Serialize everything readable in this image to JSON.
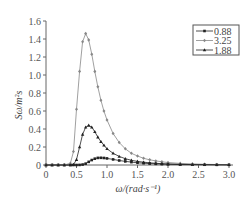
{
  "chart_data": {
    "type": "line",
    "title": "",
    "xlabel": "ω/(rad·s⁻¹)",
    "ylabel": "Sω/m²s",
    "xlim": [
      0,
      3.0
    ],
    "ylim": [
      0,
      1.6
    ],
    "xticks": [
      "0",
      "0.5",
      "1.0",
      "1.5",
      "2.0",
      "2.5",
      "3.0"
    ],
    "yticks": [
      "0",
      "0.2",
      "0.4",
      "0.6",
      "0.8",
      "1.0",
      "1.2",
      "1.4",
      "1.6"
    ],
    "grid": false,
    "legend_position": "upper right",
    "x": [
      0.0,
      0.1,
      0.2,
      0.3,
      0.4,
      0.45,
      0.5,
      0.55,
      0.6,
      0.65,
      0.7,
      0.75,
      0.8,
      0.85,
      0.9,
      0.95,
      1.0,
      1.1,
      1.2,
      1.3,
      1.4,
      1.5,
      1.6,
      1.7,
      1.8,
      1.9,
      2.0,
      2.2,
      2.4,
      2.6,
      2.8,
      3.0
    ],
    "series": [
      {
        "name": "0.88",
        "color": "#222222",
        "marker": "square",
        "values": [
          0,
          0,
          0,
          0,
          0,
          0,
          0,
          0.001,
          0.005,
          0.015,
          0.035,
          0.055,
          0.07,
          0.079,
          0.08,
          0.078,
          0.073,
          0.062,
          0.05,
          0.04,
          0.032,
          0.025,
          0.02,
          0.016,
          0.013,
          0.01,
          0.008,
          0.005,
          0.004,
          0.003,
          0.002,
          0.002
        ]
      },
      {
        "name": "3.25",
        "color": "#888888",
        "marker": "diamond",
        "values": [
          0,
          0,
          0,
          0,
          0.02,
          0.15,
          0.62,
          1.04,
          1.37,
          1.46,
          1.39,
          1.23,
          1.04,
          0.87,
          0.72,
          0.6,
          0.5,
          0.35,
          0.25,
          0.18,
          0.13,
          0.1,
          0.075,
          0.058,
          0.045,
          0.035,
          0.028,
          0.018,
          0.012,
          0.008,
          0.006,
          0.004
        ]
      },
      {
        "name": "1.88",
        "color": "#222222",
        "marker": "triangle",
        "values": [
          0,
          0,
          0,
          0,
          0,
          0.005,
          0.06,
          0.2,
          0.34,
          0.42,
          0.44,
          0.42,
          0.37,
          0.31,
          0.26,
          0.22,
          0.18,
          0.13,
          0.095,
          0.07,
          0.052,
          0.04,
          0.031,
          0.024,
          0.019,
          0.015,
          0.012,
          0.008,
          0.005,
          0.004,
          0.003,
          0.002
        ]
      }
    ]
  },
  "colors": {
    "axis": "#666666",
    "background": "#ffffff"
  }
}
